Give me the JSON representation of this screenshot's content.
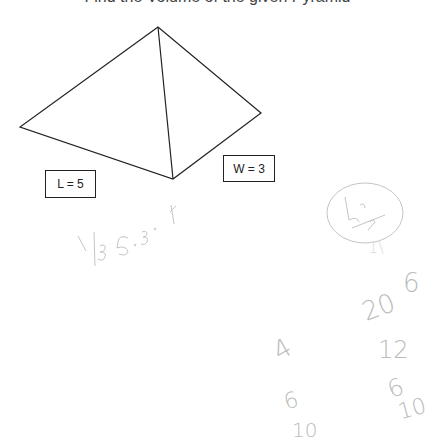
{
  "title_partial": "Find the Volume of the given Pyramid",
  "diagram": {
    "shape": "pyramid",
    "vertices": {
      "apex": [
        158,
        27
      ],
      "left": [
        20,
        127
      ],
      "bottom": [
        173,
        179
      ],
      "right": [
        261,
        113
      ]
    },
    "line_color": "#222222"
  },
  "labels": {
    "length": "L = 5",
    "width": "W = 3"
  },
  "handwriting": {
    "formula": "1/3 · 5 · 3 · h",
    "circled": "bh/2",
    "numbers": [
      "1\\",
      "6",
      "20",
      "12",
      "4",
      "6",
      "6",
      "10",
      "10"
    ],
    "ink_color": "#bbbbbb"
  }
}
